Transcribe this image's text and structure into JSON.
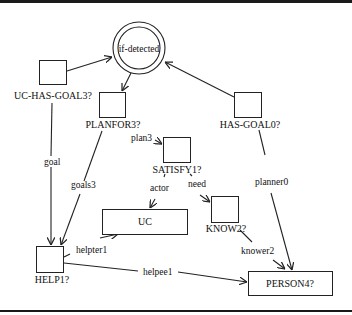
{
  "diagram": {
    "type": "semantic-network",
    "nodes": {
      "if_detected": {
        "label": "if-detected",
        "shape": "double-circle"
      },
      "uc_has_goal3": {
        "label": "UC-HAS-GOAL3?",
        "shape": "square"
      },
      "planfor3": {
        "label": "PLANFOR3?",
        "shape": "square"
      },
      "has_goal0": {
        "label": "HAS-GOAL0?",
        "shape": "square"
      },
      "satisfy1": {
        "label": "SATISFY1?",
        "shape": "square"
      },
      "uc": {
        "label": "UC",
        "shape": "rectangle"
      },
      "know2": {
        "label": "KNOW2?",
        "shape": "square"
      },
      "help1": {
        "label": "HELP1?",
        "shape": "square"
      },
      "person4": {
        "label": "PERSON4?",
        "shape": "rectangle"
      }
    },
    "edges": {
      "e1": {
        "from": "UC-HAS-GOAL3?",
        "to": "if-detected",
        "label": ""
      },
      "e2": {
        "from": "HAS-GOAL0?",
        "to": "if-detected",
        "label": ""
      },
      "e3": {
        "from": "if-detected",
        "to": "PLANFOR3?",
        "label": ""
      },
      "goal": {
        "from": "UC-HAS-GOAL3?",
        "to": "HELP1?",
        "label": "goal"
      },
      "goals3": {
        "from": "PLANFOR3?",
        "to": "HELP1?",
        "label": "goals3"
      },
      "plan3": {
        "from": "PLANFOR3?",
        "to": "SATISFY1?",
        "label": "plan3"
      },
      "actor": {
        "from": "SATISFY1?",
        "to": "UC",
        "label": "actor"
      },
      "need": {
        "from": "SATISFY1?",
        "to": "KNOW2?",
        "label": "need"
      },
      "planner0": {
        "from": "HAS-GOAL0?",
        "to": "PERSON4?",
        "label": "planner0"
      },
      "knower2": {
        "from": "KNOW2?",
        "to": "PERSON4?",
        "label": "knower2"
      },
      "helpter1": {
        "from": "HELP1?",
        "to": "UC",
        "label": "helpter1"
      },
      "helpee1": {
        "from": "HELP1?",
        "to": "PERSON4?",
        "label": "helpee1"
      }
    }
  }
}
